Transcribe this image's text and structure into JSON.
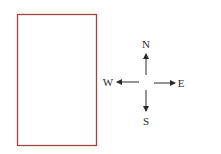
{
  "diagram": {
    "rectangle": {
      "x": 17,
      "y": 14,
      "width": 79,
      "height": 131,
      "stroke": "#a3453d",
      "fill": "#ffffff"
    },
    "compass": {
      "center": [
        146,
        83
      ],
      "color": "#2a2a2a",
      "directions": [
        {
          "key": "north",
          "label": "N"
        },
        {
          "key": "south",
          "label": "S"
        },
        {
          "key": "east",
          "label": "E"
        },
        {
          "key": "west",
          "label": "W"
        }
      ]
    }
  }
}
